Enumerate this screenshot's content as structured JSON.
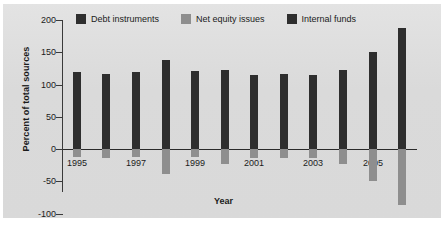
{
  "chart_data": {
    "type": "bar",
    "title": "",
    "xlabel": "Year",
    "ylabel": "Percent of total sources",
    "ylim": [
      -100,
      200
    ],
    "yticks": [
      200,
      150,
      100,
      50,
      0,
      -50,
      -100
    ],
    "ytick_labels": [
      "200",
      "150",
      "100",
      "50",
      "0",
      "-50",
      "-100"
    ],
    "grid": false,
    "legend_position": "top",
    "categories": [
      1995,
      1996,
      1997,
      1998,
      1999,
      2000,
      2001,
      2002,
      2003,
      2004,
      2005,
      2006
    ],
    "xtick_labels": [
      "1995",
      "1997",
      "1999",
      "2001",
      "2003",
      "2005"
    ],
    "xtick_labeled_years": [
      1995,
      1997,
      1999,
      2001,
      2003,
      2005
    ],
    "series": [
      {
        "name": "Debt instruments",
        "color": "#2e2e2e",
        "values": [
          119,
          117,
          119,
          138,
          121,
          122,
          115,
          116,
          115,
          123,
          151,
          187
        ]
      },
      {
        "name": "Net equity issues",
        "color": "#8e8e8e",
        "values": [
          -13,
          -14,
          -13,
          -38,
          -13,
          -23,
          -14,
          -14,
          -14,
          -24,
          -50,
          -87
        ]
      },
      {
        "name": "Internal funds",
        "color": "#2e2e2e",
        "values": [
          null,
          null,
          null,
          null,
          null,
          null,
          null,
          null,
          null,
          null,
          null,
          null
        ]
      }
    ],
    "legend": [
      {
        "label": "Debt instruments",
        "color": "#2e2e2e"
      },
      {
        "label": "Net equity issues",
        "color": "#8e8e8e"
      },
      {
        "label": "Internal funds",
        "color": "#2e2e2e"
      }
    ]
  },
  "figure": {
    "background": "#dcdcdc",
    "axis_color": "#2a2a2a"
  }
}
